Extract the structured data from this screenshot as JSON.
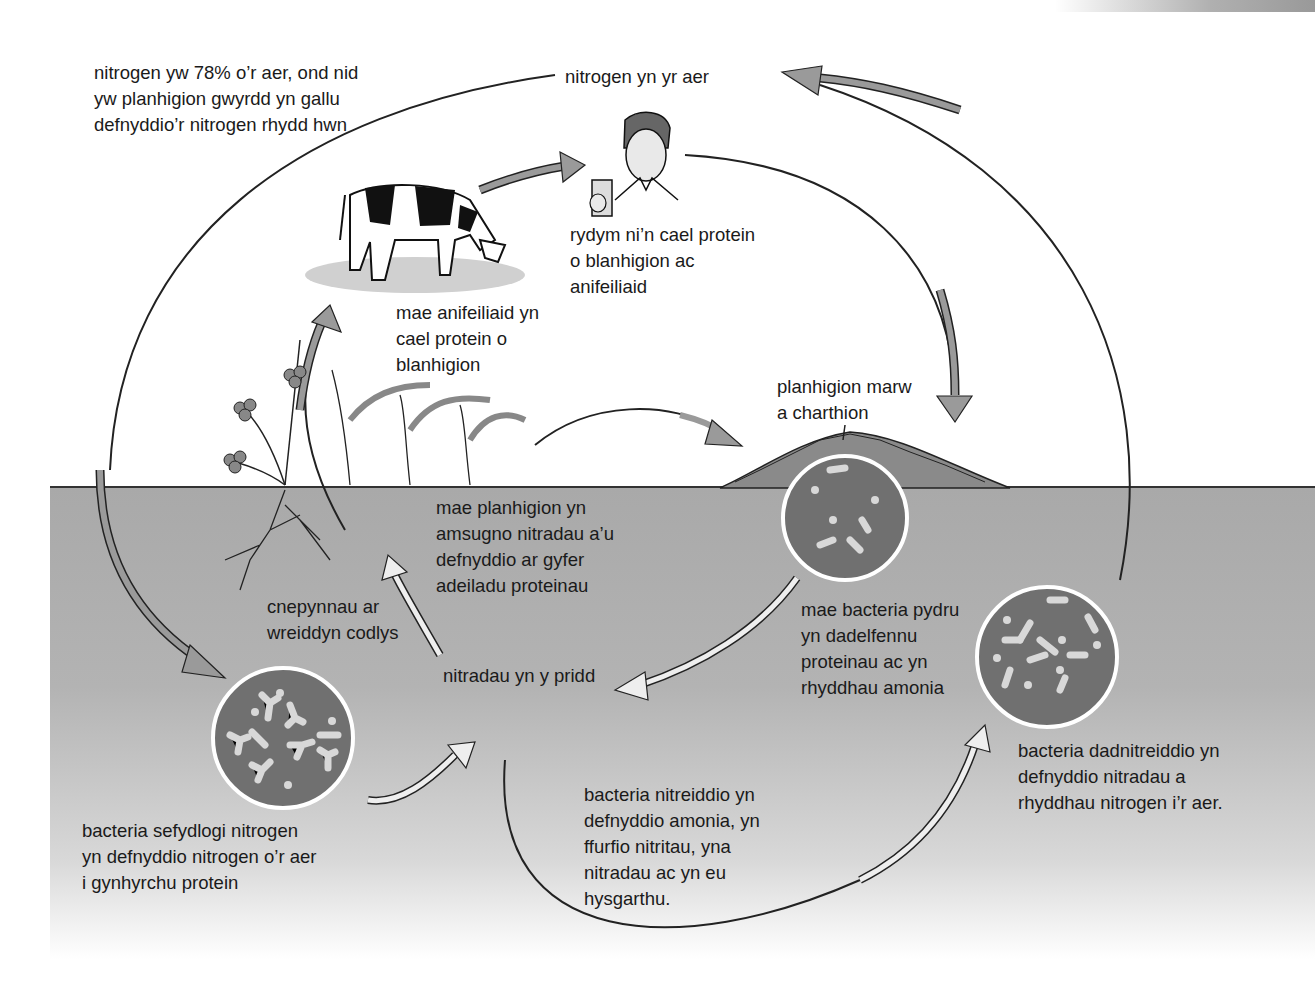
{
  "diagram": {
    "colors": {
      "soil": "#b0b0b0",
      "arrow_grey": "#9a9a9a",
      "arrow_light": "#eeeeee",
      "bacteria_disc": "#707070",
      "bacteria_cell": "#d8d8d8",
      "outline": "#222222"
    },
    "labels": {
      "air_fact": "nitrogen yw 78% o’r aer, ond nid\nyw planhigion gwyrdd yn gallu\ndefnyddio’r nitrogen rhydd hwn",
      "air_nitrogen": "nitrogen yn yr aer",
      "humans": "rydym ni’n cael protein\no blanhigion ac\nanifeiliaid",
      "animals": "mae anifeiliaid yn\ncael protein o\nblanhigion",
      "dead_matter": "planhigion marw\na charthion",
      "plants_absorb": "mae planhigion yn\namsugno nitradau a’u\ndefnyddio ar gyfer\nadeiladu proteinau",
      "root_nodules": "cnepynnau ar\nwreiddyn codlys",
      "soil_nitrates": "nitradau yn y pridd",
      "decomposers": "mae bacteria pydru\nyn dadelfennu\nproteinau ac yn\nrhyddhau amonia",
      "denitrifying": "bacteria dadnitreiddio yn\ndefnyddio nitradau a\nrhyddhau nitrogen i’r aer.",
      "nitrogen_fixing": "bacteria sefydlogi nitrogen\nyn defnyddio nitrogen o’r aer\ni gynhyrchu protein",
      "nitrifying": "bacteria nitreiddio yn\ndefnyddio amonia, yn\nffurfio nitritau, yna\nnitradau ac yn eu\nhysgarthu."
    },
    "icons": [
      "cow-illustration",
      "person-with-glass-icon",
      "clover-plant-icon",
      "rice-plant-icon",
      "decaying-matter-icon",
      "bacteria-disc-icon"
    ]
  }
}
